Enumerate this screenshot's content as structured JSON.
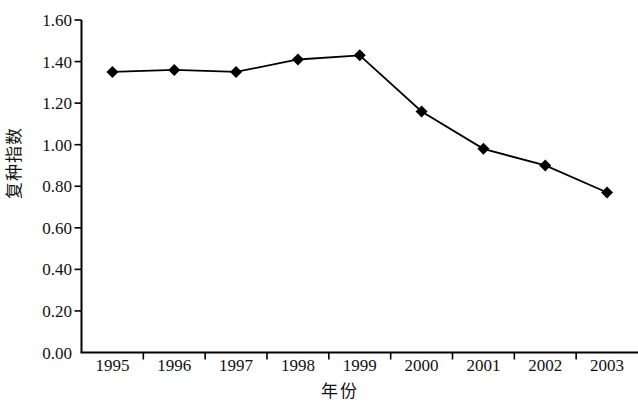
{
  "chart_data": {
    "type": "line",
    "title": "",
    "xlabel": "年份",
    "ylabel": "复种指数",
    "categories": [
      "1995",
      "1996",
      "1997",
      "1998",
      "1999",
      "2000",
      "2001",
      "2002",
      "2003"
    ],
    "values": [
      1.35,
      1.36,
      1.35,
      1.41,
      1.43,
      1.16,
      0.98,
      0.9,
      0.77
    ],
    "series": [
      {
        "name": "复种指数",
        "values": [
          1.35,
          1.36,
          1.35,
          1.41,
          1.43,
          1.16,
          0.98,
          0.9,
          0.77
        ],
        "marker": "diamond",
        "color": "#000000"
      }
    ],
    "ylim": [
      0.0,
      1.6
    ],
    "ytick_step": 0.2,
    "ytick_labels": [
      "0.00",
      "0.20",
      "0.40",
      "0.60",
      "0.80",
      "1.00",
      "1.20",
      "1.40",
      "1.60"
    ],
    "ytick_values": [
      0.0,
      0.2,
      0.4,
      0.6,
      0.8,
      1.0,
      1.2,
      1.4,
      1.6
    ],
    "grid": false,
    "legend": "none",
    "axis_color": "#000000",
    "line_color": "#000000",
    "marker_color": "#000000",
    "background": "#ffffff"
  },
  "axis": {
    "y_title": "复种指数",
    "x_title": "年份"
  }
}
